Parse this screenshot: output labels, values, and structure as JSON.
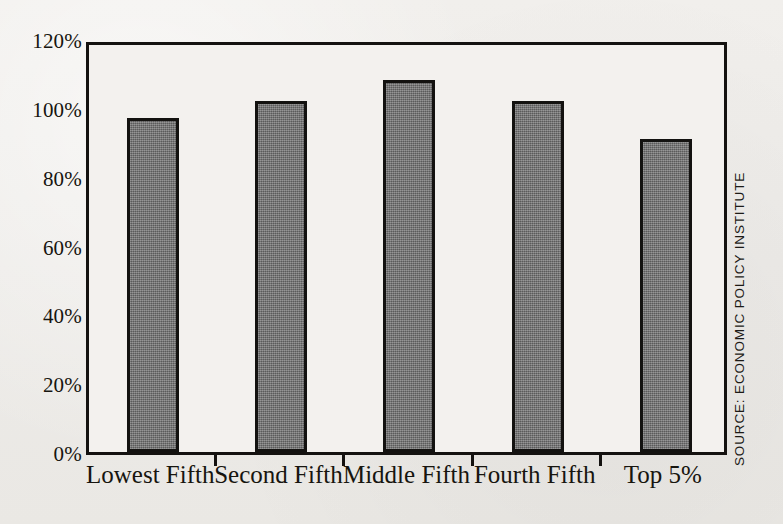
{
  "chart_data": {
    "type": "bar",
    "title": "",
    "subtitle": "",
    "xlabel": "",
    "ylabel": "",
    "categories": [
      "Lowest Fifth",
      "Second Fifth",
      "Middle Fifth",
      "Fourth Fifth",
      "Top 5%"
    ],
    "values": [
      97,
      102,
      108,
      102,
      91
    ],
    "ylim": [
      0,
      120
    ],
    "ytick_labels": [
      "120%",
      "100%",
      "80%",
      "60%",
      "40%",
      "20%",
      "0%"
    ],
    "ytick_values": [
      120,
      100,
      80,
      60,
      40,
      20,
      0
    ],
    "grid": false,
    "legend": null,
    "annotations": [],
    "series": [
      {
        "name": "",
        "values": [
          97,
          102,
          108,
          102,
          91
        ]
      }
    ],
    "colors": {
      "bar_fill": "#6f6f6f",
      "bar_stroke": "#131210",
      "axis": "#141210",
      "background": "#efedea",
      "plot_background": "#f3f1ee",
      "text": "#17150f"
    }
  },
  "source_note": "SOURCE: ECONOMIC POLICY INSTITUTE"
}
